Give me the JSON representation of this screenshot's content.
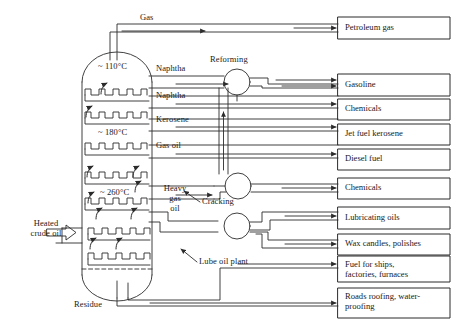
{
  "diagram": {
    "type": "process-flow",
    "stroke_color": "#2b2b2b",
    "background": "#ffffff"
  },
  "feed": {
    "label_line1": "Heated",
    "label_line2": "crude oil",
    "arrow_icon": "block-arrow-right"
  },
  "column": {
    "name": "fractionating-column",
    "tray_count": 7,
    "temperatures": [
      {
        "id": "t110",
        "label": "~ 110°C"
      },
      {
        "id": "t180",
        "label": "~ 180°C"
      },
      {
        "id": "t260",
        "label": "~ 260°C"
      }
    ],
    "bottom_label": "Residue"
  },
  "fractions": [
    {
      "id": "gas",
      "label": "Gas"
    },
    {
      "id": "naphtha-1",
      "label": "Naphtha"
    },
    {
      "id": "naphtha-2",
      "label": "Naphtha"
    },
    {
      "id": "kerosene",
      "label": "Kerosene"
    },
    {
      "id": "gas-oil",
      "label": "Gas oil"
    },
    {
      "id": "heavy-gas-oil",
      "label_line1": "Heavy",
      "label_line2": "gas",
      "label_line3": "oil"
    }
  ],
  "units": [
    {
      "id": "reforming",
      "label": "Reforming"
    },
    {
      "id": "cracking",
      "label": "Cracking"
    },
    {
      "id": "lube-oil-plant",
      "label": "Lube oil plant"
    }
  ],
  "products": [
    {
      "id": "petroleum-gas",
      "line1": "Petroleum gas",
      "line2": ""
    },
    {
      "id": "gasoline",
      "line1": "Gasoline",
      "line2": ""
    },
    {
      "id": "chemicals-1",
      "line1": "Chemicals",
      "line2": ""
    },
    {
      "id": "jet-fuel-kerosene",
      "line1": "Jet fuel kerosene",
      "line2": ""
    },
    {
      "id": "diesel-fuel",
      "line1": "Diesel fuel",
      "line2": ""
    },
    {
      "id": "chemicals-2",
      "line1": "Chemicals",
      "line2": ""
    },
    {
      "id": "lubricating-oils",
      "line1": "Lubricating oils",
      "line2": ""
    },
    {
      "id": "wax-candles-polishes",
      "line1": "Wax candles, polishes",
      "line2": ""
    },
    {
      "id": "fuel-for-ships",
      "line1": "Fuel for ships,",
      "line2": "factories, furnaces"
    },
    {
      "id": "roads-roofing",
      "line1": "Roads roofing, water-",
      "line2": "proofing"
    }
  ]
}
